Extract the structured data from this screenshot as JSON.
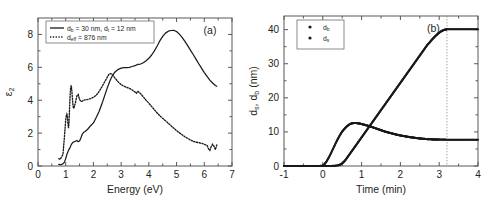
{
  "figure": {
    "panels": [
      {
        "id": "panel-a",
        "label": "(a)",
        "legend": [
          {
            "marker": "solid",
            "text": "d",
            "sub1": "b",
            "mid": " = 30 nm, d",
            "sub2": "t",
            "tail": " = 12 nm"
          },
          {
            "marker": "dotted",
            "text": "d",
            "sub1": "eff",
            "mid": " = 876 nm",
            "sub2": "",
            "tail": ""
          }
        ]
      },
      {
        "id": "panel-b",
        "label": "(b)",
        "legend": [
          {
            "marker": "dots",
            "text": "d",
            "sub1": "b"
          },
          {
            "marker": "dots",
            "text": "d",
            "sub1": "s"
          }
        ]
      }
    ]
  },
  "chart_data": [
    {
      "type": "line",
      "id": "panel-a",
      "title": "",
      "panel_label": "(a)",
      "xlabel": "Energy (eV)",
      "ylabel": "ε₂",
      "ylabel_base": "ε",
      "ylabel_sub": "2",
      "xlim": [
        0,
        7
      ],
      "ylim": [
        0,
        9
      ],
      "xticks": [
        0,
        1,
        2,
        3,
        4,
        5,
        6,
        7
      ],
      "yticks": [
        0,
        2,
        4,
        6,
        8
      ],
      "xticklabels": [
        "0",
        "1",
        "2",
        "3",
        "4",
        "5",
        "6",
        "7"
      ],
      "yticklabels": [
        "0",
        "2",
        "4",
        "6",
        "8"
      ],
      "grid": false,
      "legend_position": "upper-left",
      "series": [
        {
          "name": "d_b = 30 nm, d_t = 12 nm",
          "style": "solid",
          "x": [
            0.75,
            0.8,
            0.85,
            0.9,
            0.95,
            1.0,
            1.05,
            1.1,
            1.15,
            1.2,
            1.25,
            1.3,
            1.35,
            1.4,
            1.45,
            1.5,
            1.55,
            1.6,
            1.65,
            1.7,
            1.8,
            1.9,
            2.0,
            2.1,
            2.2,
            2.3,
            2.4,
            2.5,
            2.6,
            2.7,
            2.8,
            2.9,
            3.0,
            3.1,
            3.2,
            3.3,
            3.4,
            3.5,
            3.6,
            3.7,
            3.8,
            3.9,
            4.0,
            4.1,
            4.2,
            4.3,
            4.4,
            4.5,
            4.6,
            4.7,
            4.8,
            4.9,
            5.0,
            5.1,
            5.2,
            5.3,
            5.4,
            5.5,
            5.6,
            5.7,
            5.8,
            5.9,
            6.0,
            6.1,
            6.2,
            6.3,
            6.4,
            6.45
          ],
          "y": [
            0.1,
            0.08,
            0.1,
            0.14,
            0.22,
            0.45,
            0.75,
            0.95,
            1.1,
            1.3,
            1.42,
            1.48,
            1.5,
            1.55,
            1.48,
            1.52,
            1.72,
            1.95,
            2.05,
            2.1,
            2.25,
            2.45,
            2.62,
            2.95,
            3.3,
            3.75,
            4.25,
            4.75,
            5.2,
            5.55,
            5.75,
            5.88,
            5.95,
            5.98,
            5.98,
            6.0,
            6.05,
            6.1,
            6.18,
            6.2,
            6.28,
            6.4,
            6.55,
            6.75,
            7.0,
            7.3,
            7.62,
            7.88,
            8.08,
            8.2,
            8.24,
            8.25,
            8.18,
            8.02,
            7.82,
            7.58,
            7.32,
            7.05,
            6.78,
            6.5,
            6.22,
            5.95,
            5.68,
            5.45,
            5.22,
            5.05,
            4.9,
            4.85
          ]
        },
        {
          "name": "d_eff = 876 nm",
          "style": "dotted",
          "x": [
            0.75,
            0.8,
            0.85,
            0.9,
            0.92,
            0.95,
            0.98,
            1.0,
            1.02,
            1.04,
            1.06,
            1.08,
            1.1,
            1.12,
            1.14,
            1.16,
            1.18,
            1.2,
            1.22,
            1.24,
            1.26,
            1.28,
            1.3,
            1.35,
            1.4,
            1.45,
            1.5,
            1.55,
            1.6,
            1.65,
            1.7,
            1.8,
            1.9,
            2.0,
            2.1,
            2.2,
            2.3,
            2.4,
            2.5,
            2.55,
            2.6,
            2.65,
            2.7,
            2.8,
            2.9,
            3.0,
            3.1,
            3.2,
            3.3,
            3.4,
            3.5,
            3.55,
            3.6,
            3.7,
            3.8,
            3.9,
            4.0,
            4.1,
            4.2,
            4.3,
            4.4,
            4.5,
            4.6,
            4.7,
            4.8,
            4.9,
            5.0,
            5.1,
            5.2,
            5.3,
            5.4,
            5.5,
            5.6,
            5.7,
            5.8,
            5.9,
            6.0,
            6.1,
            6.15,
            6.2,
            6.25,
            6.3,
            6.35,
            6.4,
            6.45
          ],
          "y": [
            0.45,
            0.4,
            0.55,
            0.7,
            1.1,
            1.7,
            2.35,
            2.8,
            3.05,
            3.15,
            3.05,
            2.6,
            2.3,
            2.7,
            3.55,
            4.35,
            4.8,
            4.9,
            4.6,
            4.15,
            3.75,
            3.5,
            3.55,
            3.85,
            4.25,
            4.35,
            4.05,
            3.92,
            3.95,
            4.0,
            4.02,
            4.05,
            4.1,
            4.18,
            4.3,
            4.52,
            4.8,
            5.1,
            5.4,
            5.55,
            5.62,
            5.6,
            5.52,
            5.3,
            5.1,
            4.95,
            4.85,
            4.78,
            4.72,
            4.62,
            4.5,
            4.42,
            4.55,
            4.4,
            4.2,
            4.0,
            3.82,
            3.62,
            3.42,
            3.22,
            3.05,
            2.9,
            2.75,
            2.6,
            2.45,
            2.3,
            2.15,
            2.02,
            1.9,
            1.78,
            1.68,
            1.58,
            1.5,
            1.45,
            1.42,
            1.38,
            1.32,
            1.25,
            1.05,
            0.95,
            1.18,
            1.32,
            1.2,
            1.0,
            1.28
          ]
        }
      ]
    },
    {
      "type": "scatter",
      "id": "panel-b",
      "title": "",
      "panel_label": "(b)",
      "xlabel": "Time (min)",
      "ylabel": "d_s, d_b (nm)",
      "ylabel_parts": [
        "d",
        "s",
        ", d",
        "b",
        " (nm)"
      ],
      "xlim": [
        -1,
        4
      ],
      "ylim": [
        0,
        44
      ],
      "xticks": [
        -1,
        0,
        1,
        2,
        3,
        4
      ],
      "yticks": [
        0,
        10,
        20,
        30,
        40
      ],
      "xticklabels": [
        "-1",
        "0",
        "1",
        "2",
        "3",
        "4"
      ],
      "yticklabels": [
        "0",
        "10",
        "20",
        "30",
        "40"
      ],
      "grid": false,
      "legend_position": "upper-left",
      "annotations": [
        {
          "type": "vline",
          "x": 3.2,
          "style": "dotted",
          "label": ""
        }
      ],
      "series": [
        {
          "name": "d_b",
          "style": "dots",
          "x": [
            -1.0,
            -0.9,
            -0.8,
            -0.7,
            -0.6,
            -0.5,
            -0.4,
            -0.3,
            -0.2,
            -0.1,
            0.0,
            0.1,
            0.2,
            0.3,
            0.4,
            0.45,
            0.5,
            0.55,
            0.6,
            0.65,
            0.7,
            0.75,
            0.8,
            0.85,
            0.9,
            0.95,
            1.0,
            1.05,
            1.1,
            1.15,
            1.2,
            1.25,
            1.3,
            1.35,
            1.4,
            1.45,
            1.5,
            1.55,
            1.6,
            1.65,
            1.7,
            1.75,
            1.8,
            1.85,
            1.9,
            1.95,
            2.0,
            2.05,
            2.1,
            2.15,
            2.2,
            2.25,
            2.3,
            2.35,
            2.4,
            2.45,
            2.5,
            2.55,
            2.6,
            2.65,
            2.7,
            2.75,
            2.8,
            2.85,
            2.9,
            2.95,
            3.0,
            3.05,
            3.1,
            3.15,
            3.2,
            3.3,
            3.4,
            3.5,
            3.6,
            3.7,
            3.8,
            3.9,
            4.0
          ],
          "y": [
            0.0,
            0.0,
            0.0,
            0.0,
            0.0,
            0.0,
            0.0,
            0.0,
            0.0,
            0.0,
            0.0,
            0.0,
            0.0,
            0.05,
            0.2,
            0.4,
            0.8,
            1.3,
            2.0,
            2.8,
            3.6,
            4.4,
            5.2,
            6.0,
            6.8,
            7.6,
            8.4,
            9.2,
            10.0,
            10.8,
            11.6,
            12.4,
            13.2,
            14.0,
            14.8,
            15.6,
            16.4,
            17.2,
            18.0,
            18.8,
            19.6,
            20.4,
            21.2,
            22.0,
            22.8,
            23.6,
            24.4,
            25.2,
            26.0,
            26.8,
            27.6,
            28.4,
            29.2,
            30.0,
            30.8,
            31.6,
            32.4,
            33.2,
            34.0,
            34.8,
            35.6,
            36.2,
            36.9,
            37.5,
            38.1,
            38.6,
            39.1,
            39.5,
            39.8,
            40.0,
            40.1,
            40.1,
            40.1,
            40.1,
            40.1,
            40.1,
            40.1,
            40.1,
            40.1
          ]
        },
        {
          "name": "d_s",
          "style": "dots",
          "x": [
            -1.0,
            -0.9,
            -0.8,
            -0.7,
            -0.6,
            -0.5,
            -0.4,
            -0.3,
            -0.2,
            -0.1,
            0.0,
            0.05,
            0.1,
            0.15,
            0.2,
            0.25,
            0.3,
            0.35,
            0.4,
            0.45,
            0.5,
            0.55,
            0.6,
            0.65,
            0.7,
            0.75,
            0.8,
            0.85,
            0.9,
            0.95,
            1.0,
            1.05,
            1.1,
            1.15,
            1.2,
            1.25,
            1.3,
            1.35,
            1.4,
            1.45,
            1.5,
            1.55,
            1.6,
            1.65,
            1.7,
            1.75,
            1.8,
            1.85,
            1.9,
            1.95,
            2.0,
            2.05,
            2.1,
            2.15,
            2.2,
            2.25,
            2.3,
            2.35,
            2.4,
            2.45,
            2.5,
            2.55,
            2.6,
            2.65,
            2.7,
            2.75,
            2.8,
            2.85,
            2.9,
            2.95,
            3.0,
            3.1,
            3.2,
            3.3,
            3.4,
            3.5,
            3.6,
            3.7,
            3.8,
            3.9,
            4.0
          ],
          "y": [
            0.0,
            0.0,
            0.0,
            0.0,
            0.0,
            0.0,
            0.0,
            0.0,
            0.0,
            0.0,
            0.1,
            0.6,
            1.4,
            2.4,
            3.5,
            4.7,
            5.9,
            7.1,
            8.2,
            9.2,
            10.1,
            10.8,
            11.4,
            11.9,
            12.3,
            12.5,
            12.6,
            12.6,
            12.55,
            12.45,
            12.3,
            12.15,
            12.0,
            11.85,
            11.7,
            11.5,
            11.3,
            11.1,
            10.9,
            10.7,
            10.5,
            10.3,
            10.1,
            9.95,
            9.8,
            9.65,
            9.5,
            9.35,
            9.2,
            9.08,
            8.95,
            8.85,
            8.75,
            8.65,
            8.55,
            8.45,
            8.38,
            8.3,
            8.22,
            8.15,
            8.08,
            8.02,
            7.97,
            7.92,
            7.88,
            7.85,
            7.82,
            7.8,
            7.78,
            7.76,
            7.75,
            7.73,
            7.72,
            7.72,
            7.71,
            7.71,
            7.7,
            7.7,
            7.7,
            7.7,
            7.7
          ]
        }
      ]
    }
  ]
}
